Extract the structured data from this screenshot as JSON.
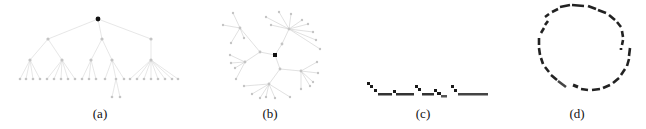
{
  "figure": {
    "panels": [
      {
        "id": "a",
        "label": "(a)",
        "kind": "hierarchical-tree-layout"
      },
      {
        "id": "b",
        "label": "(b)",
        "kind": "radial-tree-layout"
      },
      {
        "id": "c",
        "label": "(c)",
        "kind": "compact-stepped-layout"
      },
      {
        "id": "d",
        "label": "(d)",
        "kind": "circular-layout"
      }
    ],
    "colors": {
      "root_node": "#111111",
      "node": "#bdbdbd",
      "edge": "#d9d9d9",
      "segment": "#222222",
      "background": "#ffffff"
    }
  }
}
